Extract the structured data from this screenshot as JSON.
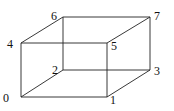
{
  "diagram": {
    "type": "cube-vertex-labeling",
    "vertices": [
      {
        "id": "0",
        "label": "0",
        "x": 21,
        "y": 97,
        "lx": 3,
        "ly": 102
      },
      {
        "id": "1",
        "label": "1",
        "x": 107,
        "y": 97,
        "lx": 110,
        "ly": 104
      },
      {
        "id": "2",
        "label": "2",
        "x": 63,
        "y": 70,
        "lx": 52,
        "ly": 74
      },
      {
        "id": "3",
        "label": "3",
        "x": 150,
        "y": 70,
        "lx": 154,
        "ly": 75
      },
      {
        "id": "4",
        "label": "4",
        "x": 21,
        "y": 43,
        "lx": 7,
        "ly": 48
      },
      {
        "id": "5",
        "label": "5",
        "x": 107,
        "y": 43,
        "lx": 111,
        "ly": 50
      },
      {
        "id": "6",
        "label": "6",
        "x": 63,
        "y": 17,
        "lx": 51,
        "ly": 20
      },
      {
        "id": "7",
        "label": "7",
        "x": 150,
        "y": 17,
        "lx": 154,
        "ly": 20
      }
    ],
    "edges": [
      [
        "0",
        "1"
      ],
      [
        "0",
        "2"
      ],
      [
        "0",
        "4"
      ],
      [
        "1",
        "3"
      ],
      [
        "1",
        "5"
      ],
      [
        "2",
        "3"
      ],
      [
        "2",
        "6"
      ],
      [
        "3",
        "7"
      ],
      [
        "4",
        "5"
      ],
      [
        "4",
        "6"
      ],
      [
        "5",
        "7"
      ],
      [
        "6",
        "7"
      ]
    ]
  }
}
